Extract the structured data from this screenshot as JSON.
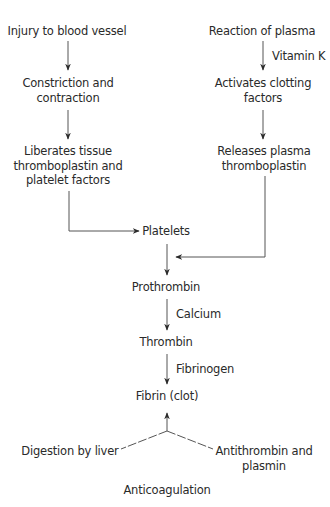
{
  "diagram": {
    "type": "flowchart",
    "left_branch": {
      "nodes": [
        {
          "id": "injury",
          "lines": [
            "Injury to blood vessel"
          ]
        },
        {
          "id": "constriction",
          "lines": [
            "Constriction and",
            "contraction"
          ]
        },
        {
          "id": "liberates",
          "lines": [
            "Liberates tissue",
            "thromboplastin and",
            "platelet factors"
          ]
        }
      ]
    },
    "right_branch": {
      "nodes": [
        {
          "id": "reaction",
          "lines": [
            "Reaction of plasma"
          ]
        },
        {
          "id": "activates",
          "lines": [
            "Activates clotting",
            "factors"
          ]
        },
        {
          "id": "releases",
          "lines": [
            "Releases plasma",
            "thromboplastin"
          ]
        }
      ],
      "edge_labels": {
        "reaction_to_activates": "Vitamin K"
      }
    },
    "center": {
      "nodes": [
        {
          "id": "platelets",
          "lines": [
            "Platelets"
          ]
        },
        {
          "id": "prothrombin",
          "lines": [
            "Prothrombin"
          ]
        },
        {
          "id": "thrombin",
          "lines": [
            "Thrombin"
          ]
        },
        {
          "id": "fibrin",
          "lines": [
            "Fibrin (clot)"
          ]
        }
      ],
      "edge_labels": {
        "prothrombin_to_thrombin": "Calcium",
        "thrombin_to_fibrin": "Fibrinogen"
      }
    },
    "anticoagulation": {
      "left": {
        "lines": [
          "Digestion by liver"
        ]
      },
      "right": {
        "lines": [
          "Antithrombin and",
          "plasmin"
        ]
      },
      "caption": "Anticoagulation"
    },
    "edges": [
      {
        "from": "injury",
        "to": "constriction"
      },
      {
        "from": "constriction",
        "to": "liberates"
      },
      {
        "from": "liberates",
        "to": "platelets"
      },
      {
        "from": "reaction",
        "to": "activates",
        "label": "Vitamin K"
      },
      {
        "from": "activates",
        "to": "releases"
      },
      {
        "from": "releases",
        "to": "platelets-prothrombin-edge"
      },
      {
        "from": "platelets",
        "to": "prothrombin"
      },
      {
        "from": "prothrombin",
        "to": "thrombin",
        "label": "Calcium"
      },
      {
        "from": "thrombin",
        "to": "fibrin",
        "label": "Fibrinogen"
      },
      {
        "from": "anticoagulation",
        "to": "fibrin",
        "style": "dashed-fork"
      }
    ]
  }
}
